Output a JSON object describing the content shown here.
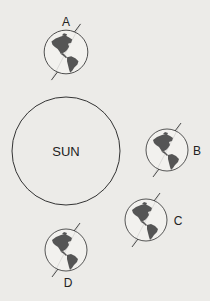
{
  "sun": {
    "label": "SUN",
    "cx": 66,
    "cy": 151,
    "r": 54
  },
  "colors": {
    "background": "#ecebe8",
    "stroke": "#333333",
    "land": "#555555",
    "ocean": "#f2f1ee"
  },
  "positions": [
    {
      "id": "A",
      "label": "A",
      "cx": 66,
      "cy": 52,
      "r": 22,
      "label_x": 66,
      "label_y": 26
    },
    {
      "id": "B",
      "label": "B",
      "cx": 167,
      "cy": 150,
      "r": 21,
      "label_x": 197,
      "label_y": 155
    },
    {
      "id": "C",
      "label": "C",
      "cx": 146,
      "cy": 220,
      "r": 21,
      "label_x": 178,
      "label_y": 225
    },
    {
      "id": "D",
      "label": "D",
      "cx": 66,
      "cy": 250,
      "r": 21,
      "label_x": 68,
      "label_y": 287
    }
  ]
}
